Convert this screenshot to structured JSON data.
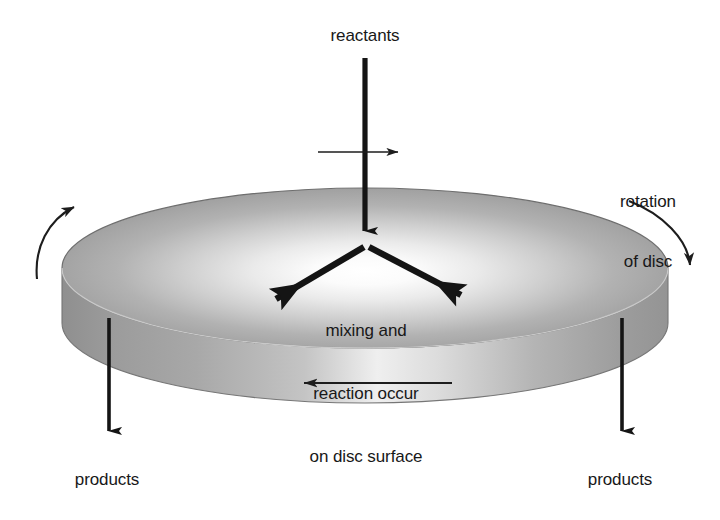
{
  "figure": {
    "background_color": "#ffffff",
    "ink_color": "#181818"
  },
  "labels": {
    "reactants": "reactants",
    "rotation_line1": "rotation",
    "rotation_line2": "of disc",
    "surface_line1": "mixing and",
    "surface_line2": "reaction occur",
    "surface_line3": "on disc surface",
    "products_left": "products",
    "products_right": "products"
  },
  "disc": {
    "top_fill_center_color": "#fdfdfd",
    "top_fill_edge_color": "#9a9a9a",
    "rim_light_color": "#f2f2f2",
    "rim_dark_color": "#9d9d9d",
    "outline_color": "#6e6e6e",
    "center_x": 365,
    "center_y": 268,
    "radius_x": 303,
    "radius_y": 80,
    "rim_depth": 55
  },
  "arrows": {
    "feed": {
      "name": "reactants-feed-arrow",
      "from_x": 365,
      "from_y": 58,
      "to_x": 365,
      "to_y": 246,
      "direction": "down"
    },
    "feed_cross": {
      "name": "feed-cross-arrow",
      "from_x": 318,
      "from_y": 152,
      "to_x": 410,
      "to_y": 152,
      "direction": "right"
    },
    "spread_left": {
      "name": "surface-spread-arrow-left",
      "from_x": 362,
      "from_y": 246,
      "to_x": 250,
      "to_y": 312,
      "direction": "down-left"
    },
    "spread_right": {
      "name": "surface-spread-arrow-right",
      "from_x": 370,
      "from_y": 246,
      "to_x": 487,
      "to_y": 307,
      "direction": "down-right"
    },
    "rim_flow": {
      "name": "rim-flow-arrow",
      "from_x": 452,
      "from_y": 383,
      "to_x": 292,
      "to_y": 383,
      "direction": "left"
    },
    "product_left": {
      "name": "products-outflow-arrow-left",
      "from_x": 109,
      "from_y": 318,
      "to_x": 109,
      "to_y": 466,
      "direction": "down"
    },
    "product_right": {
      "name": "products-outflow-arrow-right",
      "from_x": 622,
      "from_y": 318,
      "to_x": 622,
      "to_y": 466,
      "direction": "down"
    },
    "rotation_left": {
      "name": "rotation-arc-arrow-left",
      "direction": "counterclockwise-up"
    },
    "rotation_right": {
      "name": "rotation-arc-arrow-right",
      "direction": "clockwise-down"
    }
  }
}
